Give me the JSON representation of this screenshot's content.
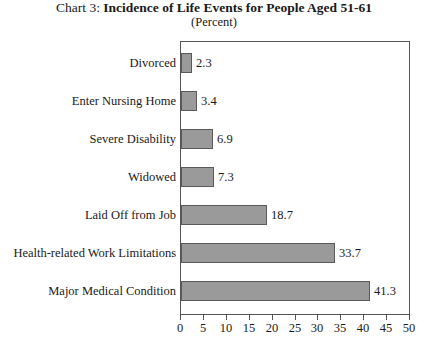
{
  "chart_data": {
    "type": "bar",
    "orientation": "horizontal",
    "title": "Chart 3: Incidence of Life Events for People Aged 51-61",
    "title_prefix": "Chart 3: ",
    "title_main": "Incidence of Life Events for People Aged 51-61",
    "subtitle": "(Percent)",
    "xlabel": "",
    "ylabel": "",
    "xlim": [
      0,
      50
    ],
    "xticks": [
      0,
      5,
      10,
      15,
      20,
      25,
      30,
      35,
      40,
      45,
      50
    ],
    "xtick_labels": [
      "0",
      "5",
      "10",
      "15",
      "20",
      "25",
      "30",
      "35",
      "40",
      "45",
      "50"
    ],
    "grid": false,
    "legend": false,
    "bar_color": "#9a9a9a",
    "bar_border_color": "#5a5a5a",
    "categories": [
      "Divorced",
      "Enter Nursing Home",
      "Severe Disability",
      "Widowed",
      "Laid Off from Job",
      "Health-related Work Limitations",
      "Major Medical Condition"
    ],
    "values": [
      2.3,
      3.4,
      6.9,
      7.3,
      18.7,
      33.7,
      41.3
    ],
    "value_labels": [
      "2.3",
      "3.4",
      "6.9",
      "7.3",
      "18.7",
      "33.7",
      "41.3"
    ]
  }
}
